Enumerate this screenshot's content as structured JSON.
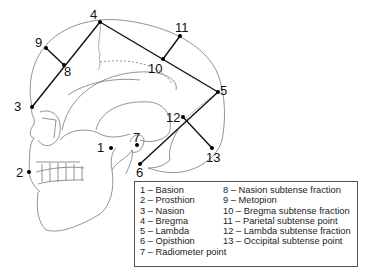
{
  "figure": {
    "points": [
      {
        "id": "1",
        "name": "Basion",
        "x": 111,
        "y": 148,
        "label_x": 97,
        "label_y": 152
      },
      {
        "id": "2",
        "name": "Prosthion",
        "x": 29,
        "y": 172,
        "label_x": 16,
        "label_y": 177
      },
      {
        "id": "3",
        "name": "Nasion",
        "x": 32,
        "y": 107,
        "label_x": 14,
        "label_y": 111
      },
      {
        "id": "4",
        "name": "Bregma",
        "x": 100,
        "y": 22,
        "label_x": 90,
        "label_y": 19
      },
      {
        "id": "5",
        "name": "Lambda",
        "x": 218,
        "y": 92,
        "label_x": 220,
        "label_y": 95
      },
      {
        "id": "6",
        "name": "Opisthion",
        "x": 140,
        "y": 164,
        "label_x": 136,
        "label_y": 177
      },
      {
        "id": "7",
        "name": "Radiometer point",
        "x": 137,
        "y": 145,
        "label_x": 133,
        "label_y": 142
      },
      {
        "id": "8",
        "name": "Nasion subtense fraction",
        "x": 64,
        "y": 65,
        "label_x": 64,
        "label_y": 76
      },
      {
        "id": "9",
        "name": "Metopion",
        "x": 46,
        "y": 48,
        "label_x": 35,
        "label_y": 47
      },
      {
        "id": "10",
        "name": "Bregma subtense fraction",
        "x": 163,
        "y": 59,
        "label_x": 148,
        "label_y": 73
      },
      {
        "id": "11",
        "name": "Parietal subtense point",
        "x": 180,
        "y": 36,
        "label_x": 175,
        "label_y": 32
      },
      {
        "id": "12",
        "name": "Lambda subtense fraction",
        "x": 183,
        "y": 117,
        "label_x": 166,
        "label_y": 122
      },
      {
        "id": "13",
        "name": "Occipital subtense point",
        "x": 212,
        "y": 148,
        "label_x": 206,
        "label_y": 162
      }
    ],
    "chords": [
      {
        "from": "3",
        "to": "4"
      },
      {
        "from": "4",
        "to": "5"
      },
      {
        "from": "5",
        "to": "6"
      },
      {
        "from": "9",
        "to": "8"
      },
      {
        "from": "11",
        "to": "10"
      },
      {
        "from": "13",
        "to": "12"
      }
    ]
  },
  "legend": {
    "left": [
      "1 – Basion",
      "2 – Prosthion",
      "3 – Nasion",
      "4 – Bregma",
      "5 – Lambda",
      "6 – Opisthion",
      "7 – Radiometer point"
    ],
    "right": [
      "8 – Nasion subtense fraction",
      "9 – Metopion",
      "10 – Bregma subtense fraction",
      "11 – Parietal subtense point",
      "12 – Lambda subtense fraction",
      "13 – Occipital subtense point"
    ]
  },
  "colors": {
    "outline": "#666666",
    "chord": "#111111",
    "text": "#222222"
  }
}
